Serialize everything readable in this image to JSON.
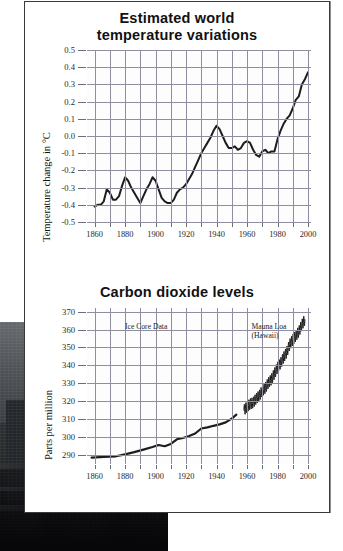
{
  "page": {
    "background_color": "#ffffff",
    "panel_color": "#ffffff",
    "border_color": "#3a3a3a",
    "curve_color": "#1d1d1d",
    "grid_color": "#8e8ea0"
  },
  "photo": {
    "caption": "",
    "semantic": "dark-cityscape-photo"
  },
  "chart_data": [
    {
      "id": "temperature",
      "type": "line",
      "title": "Estimated world\ntemperature variations",
      "title_line1": "Estimated world",
      "title_line2": "temperature variations",
      "xlabel": "",
      "ylabel": "Temperature change in °C",
      "xlim": [
        1855,
        2002
      ],
      "ylim": [
        -0.5,
        0.5
      ],
      "xticks": [
        1860,
        1880,
        1900,
        1920,
        1940,
        1960,
        1980,
        2000
      ],
      "xticklabels": [
        "1860",
        "1880",
        "1900",
        "1920",
        "1940",
        "1960",
        "1980",
        "2000"
      ],
      "xminor_step": 10,
      "yticks": [
        0.5,
        0.4,
        0.3,
        0.2,
        0.1,
        0.0,
        -0.1,
        -0.2,
        -0.3,
        -0.4,
        -0.5
      ],
      "yticklabels": [
        "0.5",
        "0.4",
        "0.3",
        "0.2",
        "0.1",
        "0.0",
        "-0.1",
        "-0.2",
        "-0.3",
        "-0.4",
        "-0.5"
      ],
      "grid": true,
      "legend": "none",
      "x": [
        1860,
        1862,
        1864,
        1866,
        1868,
        1870,
        1872,
        1874,
        1876,
        1878,
        1880,
        1882,
        1884,
        1886,
        1888,
        1890,
        1892,
        1894,
        1896,
        1898,
        1900,
        1902,
        1904,
        1906,
        1908,
        1910,
        1912,
        1914,
        1916,
        1918,
        1920,
        1922,
        1924,
        1926,
        1928,
        1930,
        1932,
        1934,
        1936,
        1938,
        1940,
        1942,
        1944,
        1946,
        1948,
        1950,
        1952,
        1954,
        1956,
        1958,
        1960,
        1962,
        1964,
        1966,
        1968,
        1970,
        1972,
        1974,
        1976,
        1978,
        1980,
        1982,
        1984,
        1986,
        1988,
        1990,
        1992,
        1994,
        1996,
        1998,
        2000
      ],
      "y": [
        -0.41,
        -0.4,
        -0.4,
        -0.38,
        -0.31,
        -0.33,
        -0.37,
        -0.37,
        -0.35,
        -0.29,
        -0.24,
        -0.26,
        -0.3,
        -0.33,
        -0.36,
        -0.39,
        -0.35,
        -0.31,
        -0.28,
        -0.24,
        -0.26,
        -0.31,
        -0.36,
        -0.38,
        -0.39,
        -0.39,
        -0.37,
        -0.33,
        -0.31,
        -0.3,
        -0.28,
        -0.25,
        -0.22,
        -0.18,
        -0.14,
        -0.1,
        -0.07,
        -0.04,
        -0.01,
        0.03,
        0.06,
        0.04,
        0.0,
        -0.04,
        -0.07,
        -0.07,
        -0.06,
        -0.08,
        -0.07,
        -0.04,
        -0.03,
        -0.04,
        -0.08,
        -0.11,
        -0.12,
        -0.09,
        -0.08,
        -0.1,
        -0.09,
        -0.09,
        -0.02,
        0.03,
        0.07,
        0.1,
        0.12,
        0.16,
        0.21,
        0.23,
        0.3,
        0.33,
        0.37
      ]
    },
    {
      "id": "co2",
      "type": "line",
      "title": "Carbon dioxide levels",
      "xlabel": "",
      "ylabel": "Parts per million",
      "xlim": [
        1855,
        2002
      ],
      "ylim": [
        285,
        372
      ],
      "xticks": [
        1860,
        1880,
        1900,
        1920,
        1940,
        1960,
        1980,
        2000
      ],
      "xticklabels": [
        "1860",
        "1880",
        "1900",
        "1920",
        "1940",
        "1960",
        "1980",
        "2000"
      ],
      "xminor_step": 10,
      "yticks": [
        370,
        360,
        350,
        340,
        330,
        320,
        310,
        300,
        290
      ],
      "yticklabels": [
        "370",
        "360",
        "350",
        "340",
        "330",
        "320",
        "310",
        "300",
        "290"
      ],
      "grid": true,
      "annotations": [
        {
          "text": "Ice Core Data",
          "x": 1880,
          "y": 361
        },
        {
          "text": "Mauna Loa",
          "x": 1963,
          "y": 361
        },
        {
          "text": "(Hawaii)",
          "x": 1963,
          "y": 356
        }
      ],
      "series": [
        {
          "name": "Ice Core Data",
          "x": [
            1858,
            1866,
            1874,
            1880,
            1886,
            1892,
            1898,
            1902,
            1906,
            1910,
            1914,
            1918,
            1922,
            1926,
            1930,
            1934,
            1938,
            1942,
            1946,
            1950,
            1953
          ],
          "values": [
            288.6,
            289.0,
            289.3,
            290.4,
            291.6,
            293.0,
            294.5,
            295.6,
            294.9,
            296.2,
            298.8,
            299.5,
            300.6,
            302.0,
            304.8,
            305.4,
            306.3,
            307.1,
            308.2,
            310.3,
            312.5
          ]
        },
        {
          "name": "Mauna Loa (Hawaii)",
          "x": [
            1958,
            1960,
            1962,
            1964,
            1966,
            1968,
            1970,
            1972,
            1974,
            1976,
            1978,
            1980,
            1982,
            1984,
            1986,
            1988,
            1990,
            1992,
            1994,
            1996,
            1998
          ],
          "values": [
            315.0,
            316.9,
            318.4,
            319.2,
            321.4,
            323.0,
            325.7,
            327.4,
            330.2,
            332.1,
            335.4,
            338.7,
            341.1,
            344.4,
            347.2,
            351.6,
            354.2,
            356.4,
            358.8,
            362.6,
            365.5
          ],
          "seasonal_amplitude": 3.0
        }
      ]
    }
  ]
}
